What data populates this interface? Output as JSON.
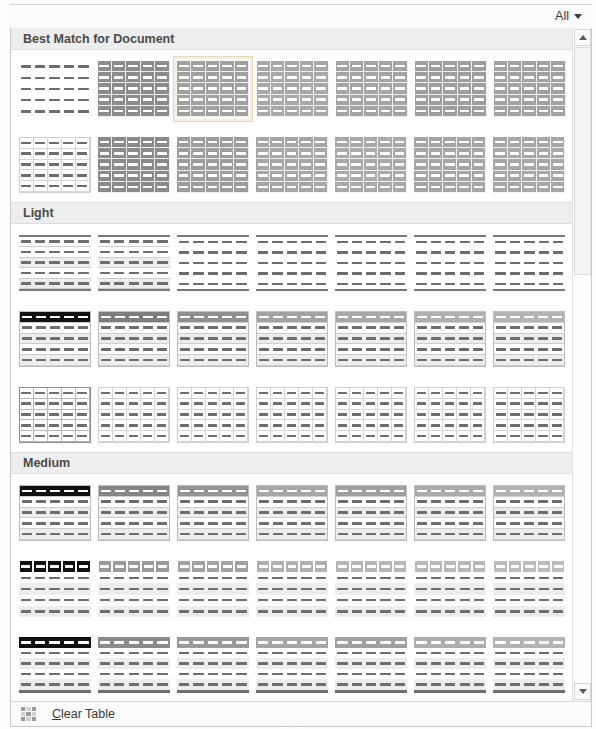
{
  "window": {
    "title": "Table Styles Gallery"
  },
  "filter_bar": {
    "dropdown_label": "All",
    "caret_icon": "chevron-down-icon"
  },
  "sections": [
    {
      "id": "best-match",
      "title": "Best Match for Document",
      "rows": [
        [
          {
            "name": "Table Grid Light",
            "style": "plain",
            "header": "none",
            "fill": "none",
            "grid": "none",
            "selected": false
          },
          {
            "name": "Plain Table 1",
            "style": "dark-fill",
            "header": "dark",
            "fill": "#8c8c8c",
            "grid": "white",
            "selected": false
          },
          {
            "name": "Grid Table 1 Light",
            "style": "mid-fill",
            "header": "mid",
            "fill": "#a0a0a0",
            "grid": "white",
            "selected": true
          },
          {
            "name": "Grid Table 2",
            "style": "mid-fill",
            "header": "mid",
            "fill": "#a8a8a8",
            "grid": "white",
            "selected": false
          },
          {
            "name": "Grid Table 3",
            "style": "mid-fill",
            "header": "mid",
            "fill": "#a4a4a4",
            "grid": "white",
            "selected": false
          },
          {
            "name": "Grid Table 4",
            "style": "mid-fill",
            "header": "mid",
            "fill": "#9e9e9e",
            "grid": "white",
            "selected": false
          },
          {
            "name": "Grid Table 5 Dark",
            "style": "mid-fill",
            "header": "mid",
            "fill": "#a2a2a2",
            "grid": "white",
            "selected": false
          }
        ],
        [
          {
            "name": "Table Grid",
            "style": "full-grid",
            "header": "none",
            "fill": "none",
            "grid": "dark",
            "selected": false
          },
          {
            "name": "List Table 1 Light",
            "style": "dark-fill",
            "header": "dark",
            "fill": "#8a8a8a",
            "grid": "white",
            "selected": false
          },
          {
            "name": "List Table 2",
            "style": "mid-fill",
            "header": "mid",
            "fill": "#9c9c9c",
            "grid": "white",
            "selected": false
          },
          {
            "name": "List Table 3",
            "style": "mid-fill",
            "header": "mid",
            "fill": "#a6a6a6",
            "grid": "white",
            "selected": false
          },
          {
            "name": "List Table 4",
            "style": "mid-fill",
            "header": "mid",
            "fill": "#a9a9a9",
            "grid": "white",
            "selected": false
          },
          {
            "name": "List Table 5 Dark",
            "style": "mid-fill",
            "header": "mid",
            "fill": "#a5a5a5",
            "grid": "white",
            "selected": false
          },
          {
            "name": "List Table 6 Colorful",
            "style": "mid-fill",
            "header": "mid",
            "fill": "#a7a7a7",
            "grid": "white",
            "selected": false
          }
        ]
      ]
    },
    {
      "id": "light",
      "title": "Light",
      "rows": [
        [
          {
            "name": "Table Grid Light",
            "style": "banded-rules",
            "header": "rule",
            "fill": "none",
            "grid": "rows",
            "selected": false
          },
          {
            "name": "Plain Table 1",
            "style": "banded-rules",
            "header": "rule",
            "fill": "none",
            "grid": "rows",
            "selected": false
          },
          {
            "name": "Plain Table 2",
            "style": "topbot",
            "header": "rule",
            "fill": "none",
            "grid": "none",
            "selected": false
          },
          {
            "name": "Plain Table 3",
            "style": "topbot",
            "header": "rule",
            "fill": "none",
            "grid": "none",
            "selected": false
          },
          {
            "name": "Plain Table 4",
            "style": "topbot",
            "header": "rule",
            "fill": "none",
            "grid": "none",
            "selected": false
          },
          {
            "name": "Plain Table 5",
            "style": "topbot",
            "header": "rule",
            "fill": "none",
            "grid": "none",
            "selected": false
          },
          {
            "name": "Table Grid Light 2",
            "style": "topbot",
            "header": "rule",
            "fill": "none",
            "grid": "none",
            "selected": false
          }
        ],
        [
          {
            "name": "Grid Table 1 Light",
            "style": "hdr-dark",
            "header": "black",
            "fill": "none",
            "grid": "rows",
            "selected": false
          },
          {
            "name": "Grid Table 2 Light",
            "style": "hdr-band",
            "header": "#7d7d7d",
            "fill": "none",
            "grid": "rows",
            "selected": false
          },
          {
            "name": "Grid Table 3 Light",
            "style": "hdr-band",
            "header": "#8f8f8f",
            "fill": "none",
            "grid": "rows",
            "selected": false
          },
          {
            "name": "Grid Table 4 Light",
            "style": "hdr-band",
            "header": "#a3a3a3",
            "fill": "none",
            "grid": "rows",
            "selected": false
          },
          {
            "name": "Grid Table 5 Light",
            "style": "hdr-band",
            "header": "#a8a8a8",
            "fill": "none",
            "grid": "rows",
            "selected": false
          },
          {
            "name": "Grid Table 6 Light",
            "style": "hdr-band",
            "header": "#b0b0b0",
            "fill": "none",
            "grid": "rows",
            "selected": false
          },
          {
            "name": "Grid Table 7 Light",
            "style": "hdr-band",
            "header": "#b4b4b4",
            "fill": "none",
            "grid": "rows",
            "selected": false
          }
        ],
        [
          {
            "name": "List Table 1 Light",
            "style": "full-grid-dark",
            "header": "none",
            "fill": "none",
            "grid": "dark",
            "selected": false
          },
          {
            "name": "List Table 2 Light",
            "style": "full-grid",
            "header": "none",
            "fill": "none",
            "grid": "light",
            "selected": false
          },
          {
            "name": "List Table 3 Light",
            "style": "full-grid",
            "header": "none",
            "fill": "none",
            "grid": "light",
            "selected": false
          },
          {
            "name": "List Table 4 Light",
            "style": "full-grid",
            "header": "none",
            "fill": "none",
            "grid": "light",
            "selected": false
          },
          {
            "name": "List Table 5 Light",
            "style": "full-grid",
            "header": "none",
            "fill": "none",
            "grid": "light",
            "selected": false
          },
          {
            "name": "List Table 6 Light",
            "style": "full-grid",
            "header": "none",
            "fill": "none",
            "grid": "light",
            "selected": false
          },
          {
            "name": "List Table 7 Light",
            "style": "full-grid",
            "header": "none",
            "fill": "none",
            "grid": "light",
            "selected": false
          }
        ]
      ]
    },
    {
      "id": "medium",
      "title": "Medium",
      "rows": [
        [
          {
            "name": "Grid Table 1 Medium",
            "style": "hdr-dark",
            "header": "black",
            "fill": "none",
            "grid": "rows",
            "selected": false
          },
          {
            "name": "Grid Table 2 Medium",
            "style": "hdr-band",
            "header": "#858585",
            "fill": "none",
            "grid": "rows",
            "selected": false
          },
          {
            "name": "Grid Table 3 Medium",
            "style": "hdr-band",
            "header": "#949494",
            "fill": "none",
            "grid": "rows",
            "selected": false
          },
          {
            "name": "Grid Table 4 Medium",
            "style": "hdr-band",
            "header": "#a6a6a6",
            "fill": "none",
            "grid": "rows",
            "selected": false
          },
          {
            "name": "Grid Table 5 Medium",
            "style": "hdr-band",
            "header": "#9f9f9f",
            "fill": "none",
            "grid": "rows",
            "selected": false
          },
          {
            "name": "Grid Table 6 Medium",
            "style": "hdr-band",
            "header": "#ababab",
            "fill": "none",
            "grid": "rows",
            "selected": false
          },
          {
            "name": "Grid Table 7 Medium",
            "style": "hdr-band",
            "header": "#b2b2b2",
            "fill": "none",
            "grid": "rows",
            "selected": false
          }
        ],
        [
          {
            "name": "List Table 1 Medium",
            "style": "hdr-cells-dark",
            "header": "black-cells",
            "fill": "none",
            "grid": "none",
            "selected": false
          },
          {
            "name": "List Table 2 Medium",
            "style": "hdr-cells",
            "header": "#9a9a9a",
            "fill": "none",
            "grid": "none",
            "selected": false
          },
          {
            "name": "List Table 3 Medium",
            "style": "hdr-cells",
            "header": "#a3a3a3",
            "fill": "none",
            "grid": "none",
            "selected": false
          },
          {
            "name": "List Table 4 Medium",
            "style": "hdr-cells",
            "header": "#b1b1b1",
            "fill": "none",
            "grid": "none",
            "selected": false
          },
          {
            "name": "List Table 5 Medium",
            "style": "hdr-cells",
            "header": "#b5b5b5",
            "fill": "none",
            "grid": "none",
            "selected": false
          },
          {
            "name": "List Table 6 Medium",
            "style": "hdr-cells",
            "header": "#b8b8b8",
            "fill": "none",
            "grid": "none",
            "selected": false
          },
          {
            "name": "List Table 7 Medium",
            "style": "hdr-cells",
            "header": "#bcbcbc",
            "fill": "none",
            "grid": "none",
            "selected": false
          }
        ],
        [
          {
            "name": "Grid Table 1 Accent",
            "style": "hdr-dark-bot",
            "header": "black",
            "fill": "none",
            "grid": "none",
            "selected": false
          },
          {
            "name": "Grid Table 2 Accent",
            "style": "hdr-band-bot",
            "header": "#8a8a8a",
            "fill": "none",
            "grid": "none",
            "selected": false
          },
          {
            "name": "Grid Table 3 Accent",
            "style": "hdr-band-bot",
            "header": "#999999",
            "fill": "none",
            "grid": "none",
            "selected": false
          },
          {
            "name": "Grid Table 4 Accent",
            "style": "hdr-band-bot",
            "header": "#a5a5a5",
            "fill": "none",
            "grid": "none",
            "selected": false
          },
          {
            "name": "Grid Table 5 Accent",
            "style": "hdr-band-bot",
            "header": "#a0a0a0",
            "fill": "none",
            "grid": "none",
            "selected": false
          },
          {
            "name": "Grid Table 6 Accent",
            "style": "hdr-band-bot",
            "header": "#aeaeae",
            "fill": "none",
            "grid": "none",
            "selected": false
          },
          {
            "name": "Grid Table 7 Accent",
            "style": "hdr-band-bot",
            "header": "#b3b3b3",
            "fill": "none",
            "grid": "none",
            "selected": false
          }
        ],
        [
          {
            "name": "List Table 1 Grid",
            "style": "full-grid-dark",
            "header": "none",
            "fill": "none",
            "grid": "dark",
            "selected": false
          },
          {
            "name": "List Table 2 Grid",
            "style": "full-grid",
            "header": "none",
            "fill": "none",
            "grid": "light",
            "selected": false
          },
          {
            "name": "List Table 3 Grid",
            "style": "full-grid",
            "header": "none",
            "fill": "none",
            "grid": "light",
            "selected": false
          },
          {
            "name": "List Table 4 Grid",
            "style": "full-grid",
            "header": "none",
            "fill": "none",
            "grid": "light",
            "selected": false
          },
          {
            "name": "List Table 5 Grid",
            "style": "full-grid",
            "header": "none",
            "fill": "none",
            "grid": "light",
            "selected": false
          },
          {
            "name": "List Table 6 Grid",
            "style": "full-grid",
            "header": "none",
            "fill": "none",
            "grid": "light",
            "selected": false
          },
          {
            "name": "List Table 7 Grid",
            "style": "full-grid",
            "header": "none",
            "fill": "none",
            "grid": "light",
            "selected": false
          }
        ]
      ]
    }
  ],
  "footer": {
    "clear_table_label_prefix": "",
    "clear_table_accel": "C",
    "clear_table_label_rest": "lear Table",
    "clear_table_full": "Clear Table",
    "icon": "clear-table-icon"
  },
  "scrollbar": {
    "up_icon": "scroll-up-arrow-icon",
    "down_icon": "scroll-down-arrow-icon",
    "thumb_position_percent": 0,
    "visible_portion_percent": 36
  },
  "colors": {
    "selection_fill": "#fdfaf3",
    "selection_border": "#e6d7b5",
    "section_header_bg": "#eeeeee",
    "section_header_text": "#4a4a4a",
    "panel_bg": "#ffffff",
    "frame_border": "#c9c9c9"
  },
  "thumb_geometry": {
    "columns": 5,
    "rows": 5
  }
}
